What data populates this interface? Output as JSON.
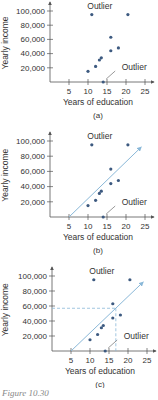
{
  "chart_data": [
    {
      "type": "scatter",
      "panel_label": "(a)",
      "xlabel": "Years of education",
      "ylabel": "Yearly income",
      "xticks": [
        5,
        10,
        15,
        20,
        25
      ],
      "yticks": [
        "20,000",
        "40,000",
        "60,000",
        "80,000",
        "100,000"
      ],
      "xlim": [
        0,
        26
      ],
      "ylim": [
        0,
        110000
      ],
      "points": [
        {
          "x": 10,
          "y": 15000
        },
        {
          "x": 11,
          "y": 95000
        },
        {
          "x": 12,
          "y": 22000
        },
        {
          "x": 13,
          "y": 31000
        },
        {
          "x": 13.5,
          "y": 34000
        },
        {
          "x": 14,
          "y": 0
        },
        {
          "x": 16,
          "y": 63000
        },
        {
          "x": 16,
          "y": 44000
        },
        {
          "x": 18,
          "y": 48000
        },
        {
          "x": 20.5,
          "y": 95000
        }
      ],
      "annotations": [
        {
          "text": "Outlier",
          "target": {
            "x": 11,
            "y": 95000
          }
        },
        {
          "text": "Outlier",
          "target": {
            "x": 14,
            "y": 0
          }
        }
      ],
      "regression_line": null
    },
    {
      "type": "scatter",
      "panel_label": "(b)",
      "xlabel": "Years of education",
      "ylabel": "Yearly income",
      "xticks": [
        5,
        10,
        15,
        20,
        25
      ],
      "yticks": [
        "20,000",
        "40,000",
        "60,000",
        "80,000",
        "100,000"
      ],
      "xlim": [
        0,
        26
      ],
      "ylim": [
        0,
        110000
      ],
      "points": [
        {
          "x": 10,
          "y": 15000
        },
        {
          "x": 11,
          "y": 95000
        },
        {
          "x": 12,
          "y": 22000
        },
        {
          "x": 13,
          "y": 31000
        },
        {
          "x": 13.5,
          "y": 34000
        },
        {
          "x": 14,
          "y": 0
        },
        {
          "x": 16,
          "y": 63000
        },
        {
          "x": 16,
          "y": 44000
        },
        {
          "x": 18,
          "y": 48000
        },
        {
          "x": 20.5,
          "y": 95000
        }
      ],
      "annotations": [
        {
          "text": "Outlier",
          "target": {
            "x": 11,
            "y": 95000
          }
        },
        {
          "text": "Outlier",
          "target": {
            "x": 14,
            "y": 0
          }
        }
      ],
      "regression_line": {
        "x1": 5,
        "y1": 0,
        "x2": 24,
        "y2": 92000,
        "arrow": true
      }
    },
    {
      "type": "scatter",
      "panel_label": "(c)",
      "xlabel": "Years of education",
      "ylabel": "Yearly income",
      "xticks": [
        5,
        10,
        15,
        20,
        25
      ],
      "yticks": [
        "20,000",
        "40,000",
        "60,000",
        "80,000",
        "100,000"
      ],
      "xlim": [
        0,
        26
      ],
      "ylim": [
        0,
        110000
      ],
      "points": [
        {
          "x": 10,
          "y": 15000
        },
        {
          "x": 11,
          "y": 95000
        },
        {
          "x": 12,
          "y": 22000
        },
        {
          "x": 13,
          "y": 31000
        },
        {
          "x": 13.5,
          "y": 34000
        },
        {
          "x": 14,
          "y": 0
        },
        {
          "x": 16,
          "y": 63000
        },
        {
          "x": 16,
          "y": 44000
        },
        {
          "x": 18,
          "y": 48000
        },
        {
          "x": 20.5,
          "y": 95000
        }
      ],
      "annotations": [
        {
          "text": "Outlier",
          "target": {
            "x": 11,
            "y": 95000
          }
        },
        {
          "text": "Outlier",
          "target": {
            "x": 14,
            "y": 0
          }
        }
      ],
      "regression_line": {
        "x1": 5,
        "y1": 0,
        "x2": 24,
        "y2": 92000,
        "arrow": true
      },
      "prediction": {
        "x": 16.8,
        "y": 57000,
        "dashed_guides": true
      }
    }
  ],
  "caption": "Figure 10.30",
  "colors": {
    "point": "#3d5a80",
    "regression": "#8ab8d8",
    "axis": "#555555",
    "dashed": "#8ab8d8"
  }
}
